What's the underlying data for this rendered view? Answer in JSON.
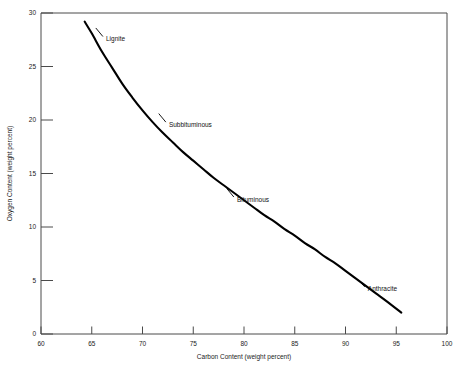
{
  "chart_data": {
    "type": "line",
    "title": "",
    "subtitle": "",
    "xlabel": "Carbon Content (weight percent)",
    "ylabel": "Oxygen Content (weight percent)",
    "xlim": [
      60,
      100
    ],
    "ylim": [
      0,
      30
    ],
    "xticks": [
      60,
      65,
      70,
      75,
      80,
      85,
      90,
      95,
      100
    ],
    "xtick_labels": [
      "60",
      "65",
      "70",
      "75",
      "80",
      "85",
      "90",
      "95",
      "100"
    ],
    "yticks": [
      0,
      5,
      10,
      15,
      20,
      25,
      30
    ],
    "ytick_labels": [
      "0",
      "5",
      "10",
      "15",
      "20",
      "25",
      "30"
    ],
    "grid": false,
    "legend_position": "none",
    "series": [
      {
        "name": "Coalification curve",
        "color": "#000000",
        "x": [
          64.3,
          65.0,
          66.0,
          67.0,
          68.0,
          69.0,
          70.0,
          71.0,
          72.0,
          73.0,
          74.0,
          75.0,
          76.0,
          77.0,
          78.0,
          79.0,
          80.0,
          81.0,
          82.0,
          83.0,
          84.0,
          85.0,
          86.0,
          87.0,
          88.0,
          89.0,
          90.0,
          91.0,
          92.0,
          93.0,
          94.0,
          95.5
        ],
        "y": [
          29.2,
          28.1,
          26.4,
          24.9,
          23.4,
          22.1,
          20.9,
          19.8,
          18.8,
          17.9,
          17.0,
          16.2,
          15.4,
          14.6,
          13.9,
          13.2,
          12.5,
          11.8,
          11.1,
          10.5,
          9.8,
          9.2,
          8.5,
          7.9,
          7.2,
          6.6,
          5.9,
          5.2,
          4.5,
          3.8,
          3.1,
          2.0
        ]
      }
    ],
    "annotations": [
      {
        "text": "Lignite",
        "x": 66.4,
        "y": 27.6,
        "leader_from_x": 65.4,
        "leader_from_y": 28.6,
        "leader_to_x": 66.1,
        "leader_to_y": 27.8
      },
      {
        "text": "Subbituminous",
        "x": 72.6,
        "y": 19.6,
        "leader_from_x": 71.6,
        "leader_from_y": 20.6,
        "leader_to_x": 72.3,
        "leader_to_y": 19.8
      },
      {
        "text": "Bituminous",
        "x": 79.3,
        "y": 12.6,
        "leader_from_x": 78.3,
        "leader_from_y": 13.6,
        "leader_to_x": 79.0,
        "leader_to_y": 12.8
      },
      {
        "text": "Anthracite",
        "x": 92.2,
        "y": 4.2,
        "leader_from_x": 91.2,
        "leader_from_y": 5.1,
        "leader_to_x": 91.9,
        "leader_to_y": 4.4
      }
    ]
  },
  "footer": {
    "smudge_text": ""
  }
}
